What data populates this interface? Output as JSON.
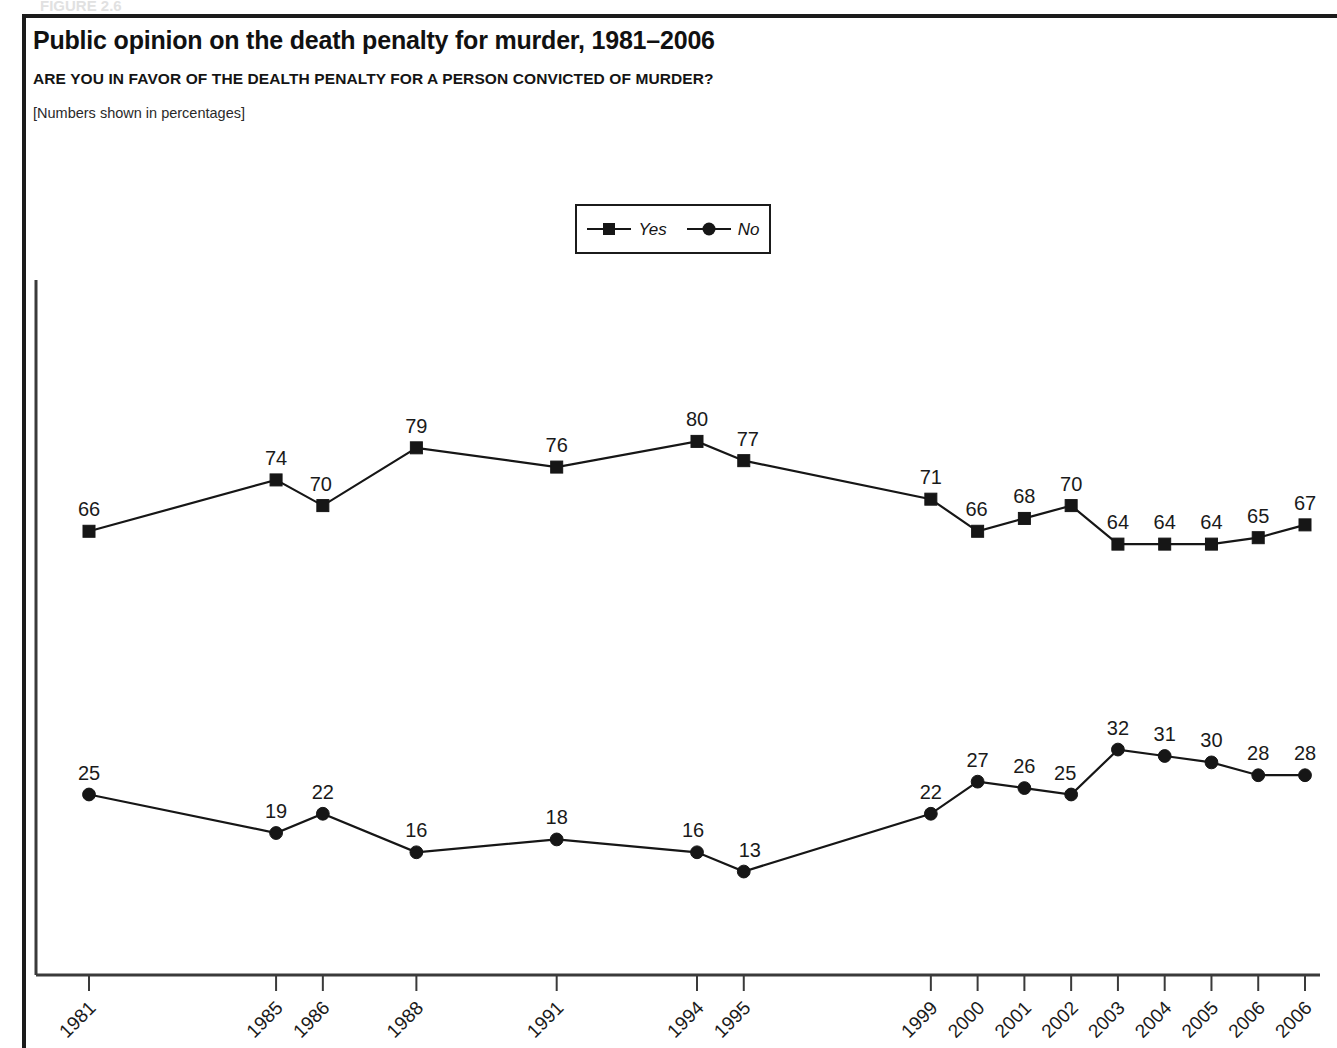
{
  "page": {
    "background": "#ffffff",
    "ink": "#161616",
    "frame_color": "#1b1b1b",
    "clipped_top_text": "FIGURE 2.6"
  },
  "header": {
    "title": "Public opinion on the death penalty for murder, 1981–2006",
    "question": "ARE YOU IN FAVOR OF THE DEALTH PENALTY FOR A PERSON CONVICTED OF MURDER?",
    "note": "[Numbers shown in percentages]"
  },
  "legend": {
    "position": "top-center",
    "entries": [
      {
        "label": "Yes",
        "marker": "square",
        "color": "#161616"
      },
      {
        "label": "No",
        "marker": "circle",
        "color": "#161616"
      }
    ]
  },
  "chart_data": {
    "type": "line",
    "title": "Public opinion on the death penalty for murder, 1981–2006",
    "subtitle": "ARE YOU IN FAVOR OF THE DEALTH PENALTY FOR A PERSON CONVICTED OF MURDER?",
    "annotation": "[Numbers shown in percentages]",
    "xlabel": "",
    "ylabel": "",
    "ylim": [
      0,
      100
    ],
    "grid": false,
    "legend_position": "top-center",
    "data_labels": true,
    "categories": [
      "1981",
      "1985",
      "1986",
      "1988",
      "1991",
      "1994",
      "1995",
      "1999",
      "2000",
      "2001",
      "2002",
      "2003",
      "2004",
      "2005",
      "2006",
      "2006"
    ],
    "x": [
      1981,
      1985,
      1986,
      1988,
      1991,
      1994,
      1995,
      1999,
      2000,
      2001,
      2002,
      2003,
      2004,
      2005,
      2006,
      2007
    ],
    "series": [
      {
        "name": "Yes",
        "marker": "square",
        "color": "#161616",
        "values": [
          66,
          74,
          70,
          79,
          76,
          80,
          77,
          71,
          66,
          68,
          70,
          64,
          64,
          64,
          65,
          67
        ]
      },
      {
        "name": "No",
        "marker": "circle",
        "color": "#161616",
        "values": [
          25,
          19,
          22,
          16,
          18,
          16,
          13,
          22,
          27,
          26,
          25,
          32,
          31,
          30,
          28,
          28
        ]
      }
    ]
  },
  "axes": {
    "x_tick_labels": [
      "1981",
      "1985",
      "1986",
      "1988",
      "1991",
      "1994",
      "1995",
      "1999",
      "2000",
      "2001",
      "2002",
      "2003",
      "2004",
      "2005",
      "2006",
      "2006"
    ],
    "x_tick_rotation_deg": 45,
    "y_tick_labels": []
  }
}
